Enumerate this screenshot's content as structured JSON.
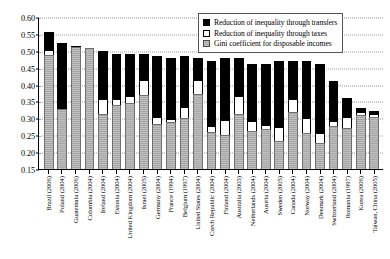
{
  "chart_data": {
    "type": "bar",
    "stacked": true,
    "title": "",
    "xlabel": "",
    "ylabel": "",
    "ylim": [
      0.15,
      0.6
    ],
    "ytick_step": 0.05,
    "ytick_labels": [
      "0.60",
      "0.55",
      "0.50",
      "0.45",
      "0.40",
      "0.35",
      "0.30",
      "0.25",
      "0.20",
      "0.15"
    ],
    "ytick_values": [
      0.6,
      0.55,
      0.5,
      0.45,
      0.4,
      0.35,
      0.3,
      0.25,
      0.2,
      0.15
    ],
    "grid": true,
    "grid_style": "dotted",
    "legend_position": "top-right",
    "categories": [
      "Brazil (2006)",
      "Poland (2004)",
      "Guatemala (2006)",
      "Colombia (2004)",
      "Ireland (2004)",
      "Estonia (2004)",
      "United Kingdom (2004)",
      "Israel (2005)",
      "Germany (2004)",
      "France (1994)",
      "Belgium (1997)",
      "United States (2004)",
      "Czech Republic (2004)",
      "Finland (2004)",
      "Australia (2003)",
      "Netherlands (2004)",
      "Austria (2004)",
      "Sweden (2005)",
      "Canada (2004)",
      "Norway (2004)",
      "Denmark (2004)",
      "Switzerland (2004)",
      "Romania (1997)",
      "Korea (2006)",
      "Taiwan, China (2005)"
    ],
    "series": [
      {
        "name": "Gini coefficient for disposable incomes",
        "color": "#a6a6a6",
        "values": [
          0.488,
          0.327,
          0.51,
          0.508,
          0.312,
          0.34,
          0.345,
          0.368,
          0.283,
          0.288,
          0.302,
          0.372,
          0.26,
          0.252,
          0.312,
          0.263,
          0.269,
          0.234,
          0.318,
          0.256,
          0.228,
          0.276,
          0.272,
          0.31,
          0.305
        ]
      },
      {
        "name": "Reduction of inequality through taxes",
        "color": "#ffffff",
        "values": [
          0.013,
          0.0,
          0.005,
          0.0,
          0.045,
          0.016,
          0.022,
          0.046,
          0.02,
          0.01,
          0.031,
          0.042,
          0.016,
          0.042,
          0.055,
          0.03,
          0.01,
          0.04,
          0.04,
          0.045,
          0.03,
          0.016,
          0.033,
          0.01,
          0.008
        ]
      },
      {
        "name": "Reduction of inequality through transfers",
        "color": "#000000",
        "values": [
          0.054,
          0.197,
          0.0,
          0.0,
          0.143,
          0.135,
          0.123,
          0.076,
          0.182,
          0.182,
          0.152,
          0.066,
          0.194,
          0.186,
          0.113,
          0.167,
          0.181,
          0.196,
          0.112,
          0.169,
          0.202,
          0.118,
          0.055,
          0.012,
          0.008
        ]
      }
    ],
    "totals": [
      0.555,
      0.524,
      0.515,
      0.508,
      0.5,
      0.491,
      0.49,
      0.49,
      0.485,
      0.48,
      0.485,
      0.48,
      0.47,
      0.48,
      0.48,
      0.46,
      0.46,
      0.47,
      0.47,
      0.47,
      0.46,
      0.41,
      0.36,
      0.332,
      0.321
    ]
  },
  "legend": {
    "items": [
      {
        "label": "Reduction of inequality through transfers",
        "swatch": "solid-black-swatch"
      },
      {
        "label": "Reduction of inequality through taxes",
        "swatch": "white-outline-swatch"
      },
      {
        "label": "Gini coefficient for disposable incomes",
        "swatch": "gray-hatched-swatch"
      }
    ]
  }
}
